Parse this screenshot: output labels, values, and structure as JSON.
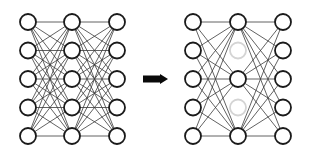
{
  "diagram": {
    "title": "",
    "colors": {
      "node_stroke": "#1a1a1a",
      "edge": "#3a3a3a",
      "dropped_node": "#d4d4d4",
      "arrow": "#0a0a0a",
      "background": "#ffffff"
    },
    "node_radius": 8,
    "left_network": {
      "label": "standard-network",
      "layers": [
        {
          "x": 28,
          "nodes": [
            22,
            50.5,
            79,
            107.5,
            136
          ]
        },
        {
          "x": 72,
          "nodes": [
            22,
            50.5,
            79,
            107.5,
            136
          ]
        },
        {
          "x": 117,
          "nodes": [
            22,
            50.5,
            79,
            107.5,
            136
          ]
        }
      ],
      "dropped": []
    },
    "arrow": {
      "x1": 143,
      "x2": 168,
      "y": 79,
      "direction": "right"
    },
    "right_network": {
      "label": "dropout-network",
      "layers": [
        {
          "x": 193,
          "nodes": [
            22,
            50.5,
            79,
            107.5,
            136
          ]
        },
        {
          "x": 238,
          "nodes": [
            22,
            50.5,
            79,
            107.5,
            136
          ]
        },
        {
          "x": 283,
          "nodes": [
            22,
            50.5,
            79,
            107.5,
            136
          ]
        }
      ],
      "dropped": [
        [
          1,
          1
        ],
        [
          1,
          3
        ]
      ]
    }
  }
}
